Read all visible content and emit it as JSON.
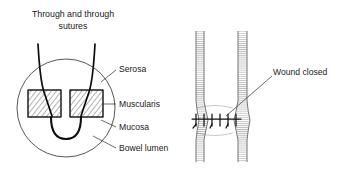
{
  "figure": {
    "title_line1": "Through and through",
    "title_line2": "sutures",
    "background_color": "#ffffff",
    "ink_color": "#111111"
  },
  "cross_section": {
    "name": "magnified-bowel-wall-cross-section",
    "labels": [
      {
        "id": "serosa",
        "text": "Serosa"
      },
      {
        "id": "muscularis",
        "text": "Muscularis"
      },
      {
        "id": "mucosa",
        "text": "Mucosa"
      },
      {
        "id": "bowel-lumen",
        "text": "Bowel lumen"
      }
    ],
    "wall_segments": 2,
    "suture_threads": 2
  },
  "bowel_tube": {
    "name": "sutured-bowel-segment",
    "label": "Wound closed",
    "stitch_count": 6
  }
}
